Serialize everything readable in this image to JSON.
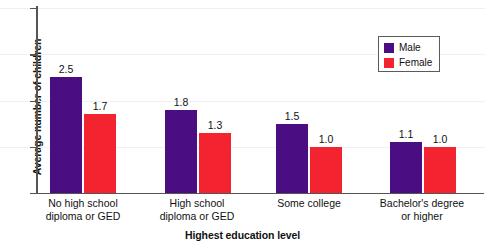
{
  "chart_data": {
    "type": "bar",
    "title": "",
    "xlabel": "Highest education level",
    "ylabel": "Average number of children",
    "categories": [
      "No high school\ndiploma or GED",
      "High school\ndiploma or GED",
      "Some college",
      "Bachelor's degree\nor higher"
    ],
    "category_lines": [
      [
        "No high school",
        "diploma or GED"
      ],
      [
        "High school",
        "diploma or GED"
      ],
      [
        "Some college",
        ""
      ],
      [
        "Bachelor's degree",
        "or higher"
      ]
    ],
    "series": [
      {
        "name": "Male",
        "color": "#4b0d82",
        "values": [
          2.5,
          1.8,
          1.5,
          1.1
        ],
        "labels": [
          "2.5",
          "1.8",
          "1.5",
          "1.1"
        ]
      },
      {
        "name": "Female",
        "color": "#f3242f",
        "values": [
          1.7,
          1.3,
          1.0,
          1.0
        ],
        "labels": [
          "1.7",
          "1.3",
          "1.0",
          "1.0"
        ]
      }
    ],
    "ylim": [
      0,
      4
    ],
    "yticks": [
      0,
      1,
      2,
      3,
      4
    ],
    "ytick_labels": [
      "0",
      "1",
      "2",
      "3",
      "4"
    ],
    "grid": true,
    "grid_axis": "y",
    "legend_position": "top-right",
    "legend_entries": [
      "Male",
      "Female"
    ]
  },
  "colors": {
    "male": "#4b0d82",
    "female": "#f3242f",
    "axis": "#555555",
    "grid": "#eef0f6",
    "text": "#111111",
    "background": "#ffffff"
  }
}
